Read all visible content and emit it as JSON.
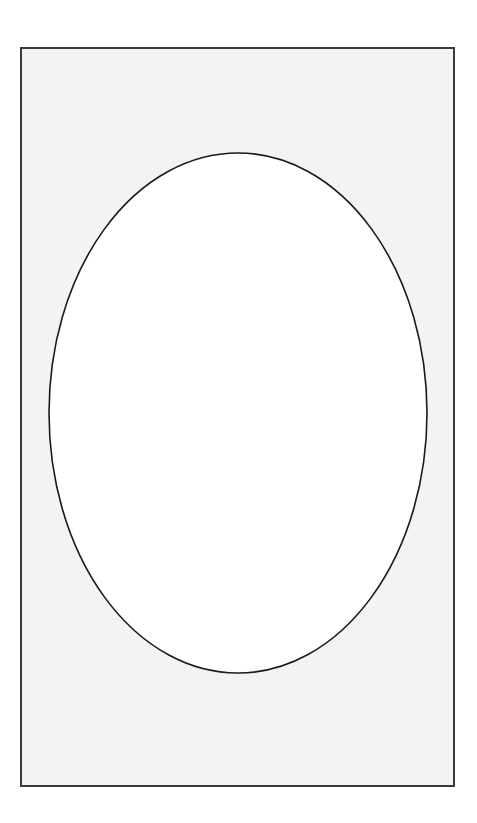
{
  "canvas": {
    "width": 477,
    "height": 823,
    "background": "#ffffff"
  },
  "frame": {
    "x": 20,
    "y": 47,
    "width": 433,
    "height": 738,
    "fill": "#f3f3f3",
    "stroke": "#3a3a3a"
  },
  "ellipse": {
    "cx": 238,
    "cy": 413,
    "rx": 189,
    "ry": 260,
    "fill": "#ffffff",
    "stroke": "#1a1a1a"
  }
}
